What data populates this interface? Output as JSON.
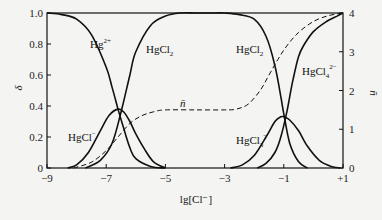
{
  "chart_data": {
    "type": "line",
    "title": "",
    "xlabel": "lg[Cl⁻]",
    "ylabel": "δ",
    "y2label": "n̄",
    "xlim": [
      -9,
      1
    ],
    "ylim": [
      0,
      1.0
    ],
    "y2lim": [
      0,
      4
    ],
    "x_ticks": [
      "-9",
      "-7",
      "-5",
      "-3",
      "-1",
      "+1"
    ],
    "y_ticks": [
      "0",
      "0.2",
      "0.4",
      "0.6",
      "0.8",
      "1.0"
    ],
    "y2_ticks": [
      "0",
      "1",
      "2",
      "3",
      "4"
    ],
    "grid": false,
    "legend": "inline labels",
    "series": [
      {
        "name": "Hg2+",
        "label_base": "Hg",
        "label_sup": "2+",
        "axis": "left",
        "style": "solid",
        "x": [
          -9,
          -8.5,
          -8,
          -7.5,
          -7,
          -6.8,
          -6.6,
          -6.4,
          -6.2,
          -6,
          -5.5,
          -5
        ],
        "values": [
          1.0,
          0.99,
          0.96,
          0.86,
          0.65,
          0.52,
          0.38,
          0.25,
          0.13,
          0.06,
          0.01,
          0.0
        ]
      },
      {
        "name": "HgCl+",
        "label_base": "HgCl",
        "label_sup": "+",
        "axis": "left",
        "style": "solid",
        "x": [
          -8.3,
          -8,
          -7.6,
          -7.2,
          -6.9,
          -6.6,
          -6.4,
          -6.2,
          -6,
          -5.7,
          -5.4,
          -5.0
        ],
        "values": [
          0.0,
          0.02,
          0.1,
          0.24,
          0.34,
          0.38,
          0.36,
          0.3,
          0.22,
          0.12,
          0.04,
          0.0
        ]
      },
      {
        "name": "HgCl2",
        "label_base": "HgCl",
        "label_sub": "2",
        "axis": "left",
        "style": "solid",
        "x": [
          -7.7,
          -7.2,
          -6.8,
          -6.5,
          -6.2,
          -6,
          -5.5,
          -5,
          -4.5,
          -4,
          -3.5,
          -3,
          -2.5,
          -2,
          -1.6,
          -1.3,
          -1.1,
          -1,
          -0.8,
          -0.5,
          -0.2
        ],
        "values": [
          0.0,
          0.05,
          0.16,
          0.36,
          0.6,
          0.75,
          0.92,
          0.98,
          1.0,
          1.0,
          1.0,
          1.0,
          0.99,
          0.96,
          0.85,
          0.66,
          0.46,
          0.35,
          0.16,
          0.04,
          0.0
        ]
      },
      {
        "name": "HgCl3-",
        "label_base": "HgCl",
        "label_sub": "3",
        "label_sup": "−",
        "axis": "left",
        "style": "solid",
        "x": [
          -2.8,
          -2.4,
          -2,
          -1.6,
          -1.3,
          -1.1,
          -1.0,
          -0.8,
          -0.5,
          -0.2,
          0.2,
          0.6,
          0.9
        ],
        "values": [
          0.0,
          0.02,
          0.08,
          0.2,
          0.3,
          0.33,
          0.33,
          0.31,
          0.24,
          0.14,
          0.05,
          0.01,
          0.0
        ]
      },
      {
        "name": "HgCl4 2-",
        "label_base": "HgCl",
        "label_sub": "4",
        "label_sup": "2−",
        "axis": "left",
        "style": "solid",
        "x": [
          -1.9,
          -1.6,
          -1.3,
          -1.1,
          -0.9,
          -0.7,
          -0.5,
          -0.3,
          0,
          0.4,
          0.8,
          1.0
        ],
        "values": [
          0.0,
          0.03,
          0.1,
          0.2,
          0.36,
          0.56,
          0.72,
          0.8,
          0.88,
          0.94,
          0.98,
          1.0
        ]
      },
      {
        "name": "n̄ (average ligand number)",
        "label_base": "n̄",
        "axis": "right",
        "style": "dashed",
        "x": [
          -8.1,
          -7.5,
          -7,
          -6.6,
          -6.2,
          -5.8,
          -5.4,
          -5,
          -4,
          -3,
          -2.6,
          -2.2,
          -1.8,
          -1.5,
          -1.2,
          -0.9,
          -0.5,
          0,
          0.5,
          1.0
        ],
        "values": [
          0.0,
          0.15,
          0.45,
          0.8,
          1.15,
          1.35,
          1.45,
          1.5,
          1.5,
          1.5,
          1.52,
          1.65,
          2.0,
          2.4,
          2.8,
          3.15,
          3.5,
          3.78,
          3.93,
          4.0
        ]
      }
    ]
  },
  "labels": {
    "hg2": {
      "base": "Hg",
      "sup": "2+"
    },
    "hgcl2_left": {
      "base": "HgCl",
      "sub": "2"
    },
    "hgcl2_right": {
      "base": "HgCl",
      "sub": "2"
    },
    "hgcl4": {
      "base": "HgCl",
      "sub": "4",
      "sup": "2−"
    },
    "hgcl": {
      "base": "HgCl",
      "sup": "−"
    },
    "hgcl3": {
      "base": "HgCl",
      "sub": "3",
      "sup": "−"
    },
    "nbar": "n̄"
  },
  "axes": {
    "x_title": "lg[Cl⁻]",
    "y_title": "δ",
    "y2_title": "n̄"
  },
  "colors": {
    "line": "#111111",
    "background": "#f4f4f2"
  }
}
